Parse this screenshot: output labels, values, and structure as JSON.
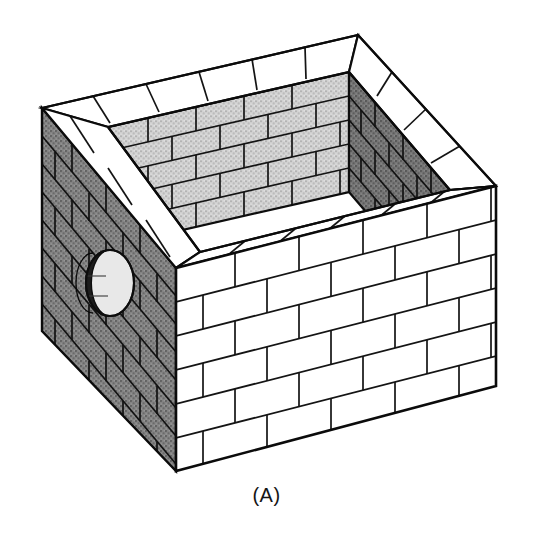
{
  "figure": {
    "caption": "(A)",
    "colors": {
      "outline": "#111111",
      "background": "#ffffff",
      "front_wall_face": "#ffffff",
      "top_coping_face": "#ffffff",
      "left_wall_face": "#808080",
      "interior_back_wall_face": "#c9c9c9",
      "interior_right_wall_face": "#6e6e6e",
      "hole_inner_dark": "#1a1a1a",
      "hole_inner_light": "#e8e8e8"
    },
    "faces": [
      {
        "name": "left-exterior-wall",
        "shade": "dark-gray",
        "texture": "stipple",
        "bond": "running-bond",
        "courses": 8,
        "has_opening": true
      },
      {
        "name": "front-right-exterior-wall",
        "shade": "white",
        "texture": "plain",
        "bond": "running-bond",
        "courses": 6,
        "has_opening": false
      },
      {
        "name": "top-coping-rim",
        "shade": "white",
        "texture": "plain",
        "bond": "stretcher-course",
        "courses": 1,
        "has_opening": false
      },
      {
        "name": "interior-back-wall",
        "shade": "light-gray",
        "texture": "stipple",
        "bond": "running-bond",
        "courses": 5,
        "has_opening": false
      },
      {
        "name": "interior-right-wall",
        "shade": "medium-dark-gray",
        "texture": "stipple",
        "bond": "running-bond",
        "courses": 5,
        "has_opening": false
      }
    ],
    "opening": {
      "name": "circular-wall-port",
      "shape": "ellipse",
      "center_x": 110,
      "center_y": 283,
      "rx": 24,
      "ry": 33,
      "located_on": "left-exterior-wall"
    },
    "geometry": {
      "top_back": [
        358,
        35
      ],
      "top_left": [
        42,
        108
      ],
      "top_right": [
        496,
        186
      ],
      "top_front": [
        176,
        268
      ],
      "bottom_left": [
        42,
        331
      ],
      "bottom_front": [
        176,
        471
      ],
      "bottom_right": [
        496,
        386
      ],
      "inner_back": [
        349,
        72
      ],
      "inner_left": [
        108,
        127
      ],
      "inner_right": [
        450,
        190
      ],
      "inner_front": [
        200,
        252
      ],
      "inner_depth_y": 120
    }
  }
}
